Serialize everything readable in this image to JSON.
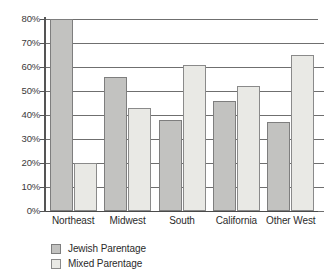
{
  "chart_data": {
    "type": "bar",
    "title": "",
    "subtitle": "",
    "xlabel": "",
    "ylabel": "",
    "ylim": [
      0,
      80
    ],
    "ytick_labels": [
      "80%",
      "70%",
      "60%",
      "50%",
      "40%",
      "30%",
      "20%",
      "10%",
      "0%"
    ],
    "ytick_values": [
      80,
      70,
      60,
      50,
      40,
      30,
      20,
      10,
      0
    ],
    "grid": true,
    "legend_position": "bottom-left",
    "categories": [
      "Northeast",
      "Midwest",
      "South",
      "California",
      "Other West"
    ],
    "series": [
      {
        "name": "Jewish Parentage",
        "color": "#c2c2c0",
        "values": [
          80,
          56,
          38,
          46,
          37
        ]
      },
      {
        "name": "Mixed Parentage",
        "color": "#e9e9e5",
        "values": [
          20,
          43,
          61,
          52,
          65
        ]
      }
    ]
  },
  "legend": {
    "items": [
      {
        "label": "Jewish Parentage",
        "swatch": "jewish"
      },
      {
        "label": "Mixed Parentage",
        "swatch": "mixed"
      }
    ]
  }
}
